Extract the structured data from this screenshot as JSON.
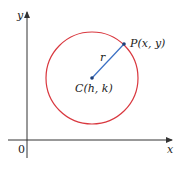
{
  "diagram": {
    "axes": {
      "x_label": "x",
      "y_label": "y",
      "origin_label": "0"
    },
    "circle": {
      "stroke_color": "#d9383f",
      "center_label": "C(h, k)",
      "point_label": "P(x, y)",
      "radius_label": "r"
    },
    "radius_line_color": "#3a6fc4",
    "axis_color": "#333333"
  }
}
